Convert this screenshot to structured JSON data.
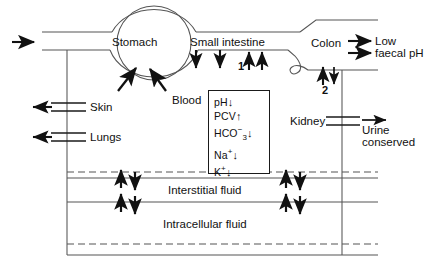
{
  "diagram": {
    "organs": {
      "stomach": "Stomach",
      "small_intestine": "Small intestine",
      "colon": "Colon",
      "skin": "Skin",
      "lungs": "Lungs",
      "kidney": "Kidney"
    },
    "markers": {
      "site_one": "1",
      "site_two": "2"
    },
    "outputs": {
      "colon_line1": "Low",
      "colon_line2": "faecal pH",
      "kidney_line1": "Urine",
      "kidney_line2": "conserved"
    },
    "blood": {
      "label": "Blood",
      "rows": [
        {
          "analyte": "pH",
          "sup": "",
          "sub": "",
          "change": "↓"
        },
        {
          "analyte": "PCV",
          "sup": "",
          "sub": "",
          "change": "↑"
        },
        {
          "analyte": "HCO",
          "sup": "−",
          "sub": "3",
          "change": "↓"
        },
        {
          "analyte": "Na",
          "sup": "+",
          "sub": "",
          "change": "↓"
        },
        {
          "analyte": "K",
          "sup": "+",
          "sub": "",
          "change": "↓"
        }
      ]
    },
    "compartments": {
      "interstitial": "Interstitial fluid",
      "intracellular": "Intracellular fluid"
    },
    "colors": {
      "stroke": "#1a1a1a",
      "thin_stroke": "#555555",
      "background": "#ffffff"
    }
  }
}
